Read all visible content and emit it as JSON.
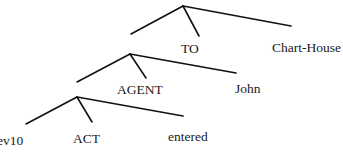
{
  "diagram": {
    "type": "tree",
    "nodes": [
      {
        "id": "n1",
        "children": [
          "n2",
          "TO",
          "Chart-House"
        ]
      },
      {
        "id": "n2",
        "children": [
          "n3",
          "AGENT",
          "John"
        ]
      },
      {
        "id": "n3",
        "children": [
          "ev10",
          "ACT",
          "entered"
        ]
      }
    ],
    "labels": {
      "to": "TO",
      "chart_house": "Chart-House",
      "agent": "AGENT",
      "john": "John",
      "ev10": "ev10",
      "act": "ACT",
      "entered": "entered"
    },
    "colors": {
      "line": "#111111",
      "text": "#1a1a1a",
      "background": "#ffffff"
    }
  }
}
